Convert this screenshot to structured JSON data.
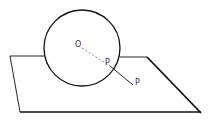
{
  "diagram": {
    "labels": {
      "center": "O",
      "tangent_point": "P",
      "external_point": "P"
    },
    "colors": {
      "stroke": "#111111",
      "dashed": "#888888",
      "background": "#ffffff"
    }
  }
}
